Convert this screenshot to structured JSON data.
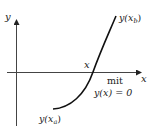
{
  "diagram": {
    "type": "function-root-sketch",
    "axes": {
      "x_label": "x",
      "y_label": "y"
    },
    "curve": {
      "start_label": "y(x",
      "start_sub": "a",
      "end_label": "y(x",
      "end_sub": "b",
      "close_paren": ")"
    },
    "root": {
      "label": "x",
      "note_line1": "mit",
      "note_line2": "y(x) = 0"
    },
    "colors": {
      "ink": "#222222",
      "background": "#ffffff"
    }
  }
}
